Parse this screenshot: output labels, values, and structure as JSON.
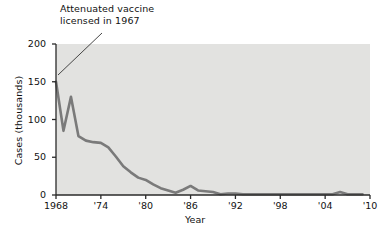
{
  "chart_data": {
    "type": "line",
    "title": "",
    "xlabel": "Year",
    "ylabel": "Cases (thousands)",
    "xlim": [
      1968,
      2010
    ],
    "ylim": [
      0,
      200
    ],
    "xticks": [
      1968,
      1974,
      1980,
      1986,
      1992,
      1998,
      2004,
      2010
    ],
    "xtick_labels": [
      "1968",
      "'74",
      "'80",
      "'86",
      "'92",
      "'98",
      "'04",
      "'10"
    ],
    "yticks": [
      0,
      50,
      100,
      150,
      200
    ],
    "ytick_labels": [
      "0",
      "50",
      "100",
      "150",
      "200"
    ],
    "grid": false,
    "legend": null,
    "series": [
      {
        "name": "Measles cases",
        "x": [
          1968,
          1969,
          1970,
          1971,
          1972,
          1973,
          1974,
          1975,
          1976,
          1977,
          1978,
          1979,
          1980,
          1981,
          1982,
          1983,
          1984,
          1985,
          1986,
          1987,
          1988,
          1989,
          1990,
          1991,
          1992,
          1993,
          1994,
          1995,
          1996,
          1997,
          1998,
          1999,
          2000,
          2001,
          2002,
          2003,
          2004,
          2005,
          2006,
          2007,
          2008,
          2009
        ],
        "values": [
          150,
          85,
          130,
          78,
          72,
          70,
          69,
          63,
          51,
          38,
          30,
          23,
          20,
          14,
          9,
          6,
          3,
          7,
          12,
          6,
          5,
          4,
          1,
          2,
          2,
          1,
          1,
          1,
          1,
          1,
          1,
          1,
          1,
          1,
          1,
          1,
          1,
          1,
          4,
          1,
          1,
          1
        ]
      }
    ],
    "annotations": [
      {
        "text": "Attenuated vaccine\nlicensed in 1967",
        "points_to_year": 1968,
        "points_to_value": 150
      }
    ],
    "colors": {
      "line": "#7a7a7a",
      "plot_background": "#e2e2e0",
      "axis": "#2a2a2a",
      "text": "#111111"
    }
  }
}
